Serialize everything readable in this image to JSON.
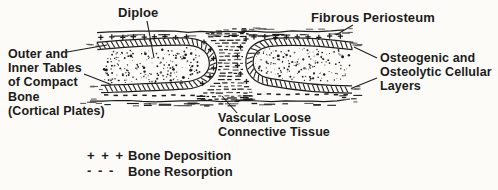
{
  "diagram": {
    "labels": {
      "diploe": "Diploe",
      "fibrous_periosteum": "Fibrous Periosteum",
      "compact_bone": {
        "lines": [
          "Outer and",
          "Inner Tables",
          "of Compact",
          "Bone",
          "(Cortical Plates)"
        ]
      },
      "cellular_layers": {
        "lines": [
          "Osteogenic and",
          "Osteolytic Cellular",
          "Layers"
        ]
      },
      "vascular_tissue": {
        "lines": [
          "Vascular Loose",
          "Connective Tissue"
        ]
      }
    },
    "legend": {
      "items": [
        {
          "symbol": "+ + +",
          "label": "Bone Deposition"
        },
        {
          "symbol": "- - -",
          "label": "Bone Resorption"
        }
      ]
    },
    "colors": {
      "ink": "#1d1d1d",
      "paper": "#fcfbf8",
      "faded": "#5c5c5c"
    }
  }
}
